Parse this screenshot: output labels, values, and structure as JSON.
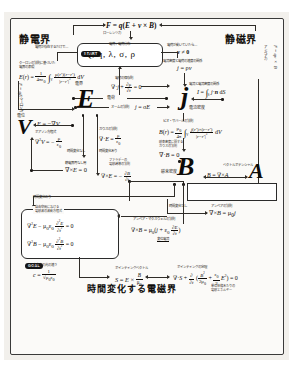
{
  "document": {
    "title": "時間変化する電磁界",
    "left_section": "静電界",
    "right_section": "静磁界"
  },
  "badges": {
    "start": "START",
    "goal": "GOAL"
  },
  "nodes": {
    "lorentz_formula": "F = q(E + v × B)",
    "lorentz_label": "ローレンツ力",
    "source_caption": "電荷 / 電荷分布",
    "source_symbols": "Q, q, λ, σ, ρ",
    "static_note": "電荷が存在するだけで…",
    "moving_note": "電荷が動いていたら…",
    "v_not_zero": "v ≠ 0",
    "coulomb_law_caption": "クーロンの法則に基づいた\n電界の表現",
    "coulomb_field": "E(r) = 1/(4πε₀) ∫ᵥ ρ(r′)(r−r′)/|r−r′|³ dV",
    "coulomb_force_label": "クーロン力",
    "coulomb_force": "F = qE",
    "ampere_force_label": "アンペア力",
    "ampere_force": "F = qv × B",
    "current_density_relation_caption": "電流密度と電荷の速度の関係",
    "current_density_relation": "j = ρv",
    "charge_conservation_caption": "電荷の保存則",
    "charge_conservation": "∇·j + ∂ρ/∂t = 0",
    "ohm_law_caption": "オームの法則",
    "ohm_law": "j = σE",
    "current_caption": "電流と電流密度の関係",
    "current_integral": "I = ∫ₛ j·n dS",
    "electric_field_glyph": "E",
    "electric_field_label": "電界",
    "current_density_glyph": "j",
    "current_density_label": "電流密度",
    "magnetic_field_glyph": "B",
    "magnetic_field_label": "磁束密度",
    "vector_potential_glyph": "A",
    "vector_potential_label": "ベクトルポテンシャル",
    "potential_glyph": "V",
    "potential_label": "電位",
    "e_gradient": "E = −∇V",
    "poisson_caption": "ポアソン方程式",
    "poisson": "∇²V = −ρ/ε₀",
    "gauss_caption": "ガウスの法則",
    "gauss": "∇·E = ρ/ε₀",
    "no_time_label": "時間変化なし",
    "time_label": "時間変化あり",
    "curl_e_zero_caption": "静電界再なし用",
    "curl_e_zero": "∇×E = 0",
    "faraday_caption": "ファラデーの\n電磁誘導の法則",
    "faraday": "∇×E = −∂B/∂t",
    "biot_savart_caption": "ビオ・サバールの法則",
    "biot_savart": "B(r) = μ₀/(4π) ∫ᵥ j(r′)×(r−r′)/|r−r′|³ dV",
    "gauss_magnetic_caption": "磁束密度に関する\nガウスの法則",
    "gauss_magnetic": "∇·B = 0",
    "b_curl_a": "B = ∇×A",
    "vector_potential_formula": "A(r) = μ₀/(4π) ∫ᵥ j(r′)/|r−r′| dV",
    "ampere_law_caption": "アンペアの法則",
    "ampere_law": "∇×B = μ₀ j",
    "ampere_maxwell_caption": "アンペア・マクスウェルの法則",
    "ampere_maxwell": "∇×B = μ₀(j + ε₀ ∂E/∂t)",
    "displacement_current": "変位電流",
    "wave_caption": "自由空間における\n電磁波の波動方程式",
    "wave_e": "∇²E − μ₀ε₀ ∂²E/∂t² = 0",
    "wave_b": "∇²B − μ₀ε₀ ∂²B/∂t² = 0",
    "light_speed_caption": "真空中の光の速さ",
    "light_speed": "c = 1/√(μ₀ε₀)",
    "poynting_vector_caption": "ポインティングベクトル",
    "poynting_vector": "S = E × B/μ₀",
    "poynting_theorem_caption": "ポインティングの定理",
    "poynting_theorem": "∇·S + ∂/∂t (B²/2μ₀ + ε₀E²/2) = 0",
    "energy_note": "単位体積あたりの\n電磁エネルギー"
  },
  "colors": {
    "ink": "#15120f",
    "paper": "#fbfaf8",
    "sheet": "#f2f0ec",
    "badge": "#141414"
  }
}
